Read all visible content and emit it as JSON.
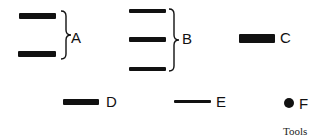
{
  "figure": {
    "caption": "Tools",
    "colors": {
      "ink": "#111111",
      "background": "#ffffff"
    },
    "groups": [
      {
        "id": "A",
        "label": "A",
        "shape": "two thick bars with brace",
        "bar_count": 2
      },
      {
        "id": "B",
        "label": "B",
        "shape": "three bars with brace",
        "bar_count": 3
      },
      {
        "id": "C",
        "label": "C",
        "shape": "single thick short bar",
        "bar_count": 1
      },
      {
        "id": "D",
        "label": "D",
        "shape": "single medium bar",
        "bar_count": 1
      },
      {
        "id": "E",
        "label": "E",
        "shape": "single thin bar",
        "bar_count": 1
      },
      {
        "id": "F",
        "label": "F",
        "shape": "dot",
        "bar_count": 0
      }
    ]
  }
}
